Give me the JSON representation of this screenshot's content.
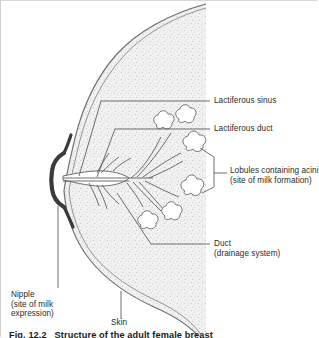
{
  "figure": {
    "title": "Structure of the adult female breast",
    "caption_partial": "Fig. 12.2   Structure of the adult female breast",
    "colors": {
      "tissue_fill": "#f0f0f0",
      "stipple": "#c9c9c9",
      "outline": "#7a7a7a",
      "nipple": "#3a3a3a",
      "leader": "#555555",
      "text": "#2b2b2b",
      "frame_border": "#cfcfcf"
    }
  },
  "labels": [
    {
      "id": "lactiferous-sinus",
      "text": "Lactiferous sinus",
      "lines": [
        "Lactiferous sinus"
      ]
    },
    {
      "id": "lactiferous-duct",
      "text": "Lactiferous duct",
      "lines": [
        "Lactiferous duct"
      ]
    },
    {
      "id": "lobules-acini",
      "text": "Lobules containing acini (site of milk formation)",
      "lines": [
        "Lobules containing acini",
        "(site of milk formation)"
      ]
    },
    {
      "id": "duct",
      "text": "Duct (drainage system)",
      "lines": [
        "Duct",
        "(drainage system)"
      ]
    },
    {
      "id": "nipple",
      "text": "Nipple (site of milk expression)",
      "lines": [
        "Nipple",
        "(site of milk",
        "expression)"
      ]
    },
    {
      "id": "skin",
      "text": "Skin",
      "lines": [
        "Skin"
      ]
    }
  ],
  "anatomy": {
    "parts": [
      "breast-outline",
      "skin-double-line",
      "nipple-profile",
      "lactiferous-sinus",
      "duct-tree",
      "lobule-clusters"
    ],
    "lobule_count": 6
  }
}
